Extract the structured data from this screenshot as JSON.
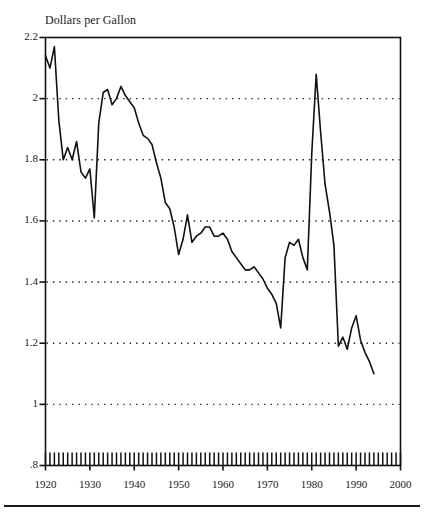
{
  "figure": {
    "title": "Dollars per Gallon",
    "line_color": "#111111",
    "grid_color": "#222222",
    "axis_color": "#111111",
    "background": "#ffffff"
  },
  "chart_data": {
    "type": "line",
    "title": "Dollars per Gallon",
    "xlabel": "",
    "ylabel": "Dollars per Gallon",
    "xlim": [
      1920,
      2000
    ],
    "ylim": [
      0.8,
      2.2
    ],
    "yticks": [
      "2.2",
      "2",
      "1.8",
      "1.6",
      "1.4",
      "1.2",
      "1",
      ".8"
    ],
    "ytick_values": [
      2.2,
      2.0,
      1.8,
      1.6,
      1.4,
      1.2,
      1.0,
      0.8
    ],
    "xticks": [
      "1920",
      "1930",
      "1940",
      "1950",
      "1960",
      "1970",
      "1980",
      "1990",
      "2000"
    ],
    "xtick_values": [
      1920,
      1930,
      1940,
      1950,
      1960,
      1970,
      1980,
      1990,
      2000
    ],
    "x_minor_tick_interval": 1,
    "grid": "horizontal dotted at each major y tick",
    "legend": "none",
    "series": [
      {
        "name": "Real gasoline price",
        "x": [
          1920,
          1921,
          1922,
          1923,
          1924,
          1925,
          1926,
          1927,
          1928,
          1929,
          1930,
          1931,
          1932,
          1933,
          1934,
          1935,
          1936,
          1937,
          1938,
          1939,
          1940,
          1941,
          1942,
          1943,
          1944,
          1945,
          1946,
          1947,
          1948,
          1949,
          1950,
          1951,
          1952,
          1953,
          1954,
          1955,
          1956,
          1957,
          1958,
          1959,
          1960,
          1961,
          1962,
          1963,
          1964,
          1965,
          1966,
          1967,
          1968,
          1969,
          1970,
          1971,
          1972,
          1973,
          1974,
          1975,
          1976,
          1977,
          1978,
          1979,
          1980,
          1981,
          1982,
          1983,
          1984,
          1985,
          1986,
          1987,
          1988,
          1989,
          1990,
          1991,
          1992,
          1993,
          1994
        ],
        "values": [
          2.14,
          2.1,
          2.17,
          1.93,
          1.8,
          1.84,
          1.8,
          1.86,
          1.76,
          1.74,
          1.77,
          1.61,
          1.92,
          2.02,
          2.03,
          1.98,
          2.0,
          2.04,
          2.01,
          1.99,
          1.97,
          1.92,
          1.88,
          1.87,
          1.85,
          1.79,
          1.74,
          1.66,
          1.64,
          1.58,
          1.49,
          1.54,
          1.62,
          1.53,
          1.55,
          1.56,
          1.58,
          1.58,
          1.55,
          1.55,
          1.56,
          1.54,
          1.5,
          1.48,
          1.46,
          1.44,
          1.44,
          1.45,
          1.43,
          1.41,
          1.38,
          1.36,
          1.33,
          1.25,
          1.48,
          1.53,
          1.52,
          1.54,
          1.48,
          1.44,
          1.82,
          2.08,
          1.89,
          1.72,
          1.63,
          1.52,
          1.19,
          1.22,
          1.18,
          1.25,
          1.29,
          1.21,
          1.17,
          1.14,
          1.1
        ]
      }
    ]
  }
}
